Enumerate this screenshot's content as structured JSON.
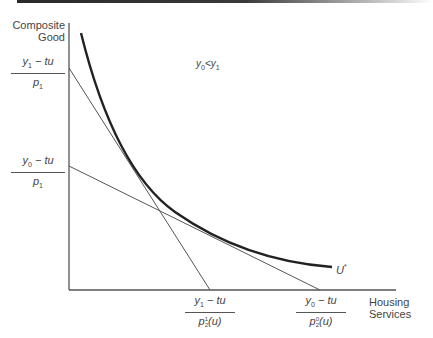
{
  "figure": {
    "y_axis_label": [
      "Composite",
      "Good"
    ],
    "x_axis_label": [
      "Housing",
      "Services"
    ],
    "condition": {
      "a": "y",
      "a_sub": "0",
      "rel": "<",
      "b": "y",
      "b_sub": "1"
    },
    "curve_label": {
      "base": "U",
      "sup": "*"
    },
    "y_intercepts": [
      {
        "num_var": "y",
        "num_sub": "1",
        "num_rest": " − tu",
        "den_var": "p",
        "den_sub": "1"
      },
      {
        "num_var": "y",
        "num_sub": "0",
        "num_rest": " − tu",
        "den_var": "p",
        "den_sub": "1"
      }
    ],
    "x_intercepts": [
      {
        "num_var": "y",
        "num_sub": "1",
        "num_rest": " − tu",
        "den_var": "p",
        "den_sup": "1",
        "den_sub": "2",
        "den_rest": "(u)"
      },
      {
        "num_var": "y",
        "num_sub": "0",
        "num_rest": " − tu",
        "den_var": "p",
        "den_sup": "0",
        "den_sub": "2",
        "den_rest": "(u)"
      }
    ],
    "colors": {
      "axis": "#555555",
      "curve": "#222222",
      "budget_line": "#555555"
    }
  }
}
